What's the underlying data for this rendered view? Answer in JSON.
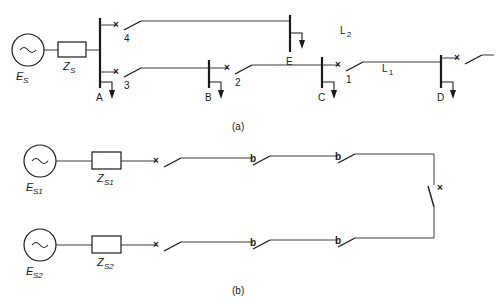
{
  "figure": {
    "title": "",
    "captions": [
      {
        "id": "cap-a",
        "text": "(a)"
      },
      {
        "id": "cap-b",
        "text": "(b)"
      }
    ]
  },
  "diagram_a": {
    "source": {
      "symbol": "~",
      "emf_label": "E",
      "emf_sub": "S",
      "impedance_label": "Z",
      "impedance_sub": "S"
    },
    "buses": [
      {
        "name": "A",
        "label": "A"
      },
      {
        "name": "B",
        "label": "B"
      },
      {
        "name": "C",
        "label": "C"
      },
      {
        "name": "D",
        "label": "D"
      },
      {
        "name": "E",
        "label": "E"
      }
    ],
    "switches": [
      {
        "name": "switch-4",
        "label": "4",
        "mark": "×"
      },
      {
        "name": "switch-3",
        "label": "3",
        "mark": "×"
      },
      {
        "name": "switch-2",
        "label": "2",
        "mark": "×"
      },
      {
        "name": "switch-1",
        "label": "1",
        "mark": "×"
      },
      {
        "name": "switch-d",
        "label": "",
        "mark": "×"
      }
    ],
    "lines": [
      {
        "name": "line-L2",
        "label": "L",
        "sub": "2"
      },
      {
        "name": "line-L1",
        "label": "L",
        "sub": "1"
      }
    ]
  },
  "diagram_b": {
    "feeder_1": {
      "symbol": "~",
      "emf_label": "E",
      "emf_sub": "S1",
      "impedance_label": "Z",
      "impedance_sub": "S1",
      "switch_marks": [
        "×",
        "b",
        "b"
      ]
    },
    "feeder_2": {
      "symbol": "~",
      "emf_label": "E",
      "emf_sub": "S2",
      "impedance_label": "Z",
      "impedance_sub": "S2",
      "switch_marks": [
        "×",
        "b",
        "b"
      ]
    },
    "tie_switch": {
      "name": "tie-switch",
      "mark": "×"
    }
  },
  "colors": {
    "ink": "#1a1a1a",
    "wire": "#3a3a3a",
    "background": "#ffffff"
  }
}
